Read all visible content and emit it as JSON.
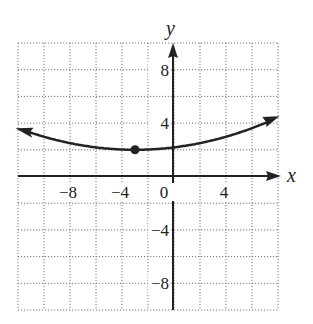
{
  "chart_data": {
    "type": "line",
    "title": "",
    "xlabel": "x",
    "ylabel": "y",
    "xlim": [
      -12,
      8
    ],
    "ylim": [
      -10,
      10
    ],
    "grid": true,
    "grid_step": 2,
    "x_ticks": [
      {
        "value": -8,
        "label": "−8"
      },
      {
        "value": -4,
        "label": "−4"
      },
      {
        "value": 0,
        "label": "0"
      },
      {
        "value": 4,
        "label": "4"
      }
    ],
    "y_ticks": [
      {
        "value": 8,
        "label": "8"
      },
      {
        "value": 4,
        "label": "4"
      },
      {
        "value": -4,
        "label": "−4"
      },
      {
        "value": -8,
        "label": "−8"
      }
    ],
    "series": [
      {
        "name": "parabola",
        "equation": "y = (1/50)(x + 3)^2 + 2",
        "x": [
          -12,
          -9,
          -6,
          -3,
          0,
          3,
          6,
          8
        ],
        "y": [
          3.6,
          2.7,
          2.2,
          2.0,
          2.2,
          2.7,
          3.6,
          4.4
        ],
        "arrows_both_ends": true
      }
    ],
    "points": [
      {
        "x": -3,
        "y": 2,
        "label": "vertex"
      }
    ]
  }
}
